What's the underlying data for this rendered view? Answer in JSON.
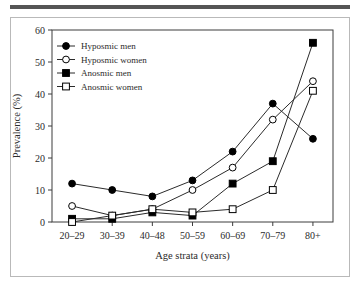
{
  "figure": {
    "top_rule_color": "#555555",
    "frame_color": "#b9b9b9"
  },
  "chart_data": {
    "type": "line",
    "title": "",
    "xlabel": "Age strata (years)",
    "ylabel": "Prevalence (%)",
    "categories": [
      "20–29",
      "30–39",
      "40–48",
      "50–59",
      "60–69",
      "70–79",
      "80+"
    ],
    "ylim": [
      0,
      60
    ],
    "yticks": [
      0,
      10,
      20,
      30,
      40,
      50,
      60
    ],
    "ytick_labels": [
      "0",
      "10",
      "20",
      "30",
      "40",
      "50",
      "60"
    ],
    "grid": false,
    "legend_position": "upper left",
    "series": [
      {
        "name": "Hyposmic men",
        "marker": "filled-circle",
        "color": "#000000",
        "values": [
          12,
          10,
          8,
          13,
          22,
          37,
          26
        ]
      },
      {
        "name": "Hyposmic women",
        "marker": "open-circle",
        "color": "#000000",
        "values": [
          5,
          2,
          4,
          10,
          17,
          32,
          44
        ]
      },
      {
        "name": "Anosmic men",
        "marker": "filled-square",
        "color": "#000000",
        "values": [
          1,
          1,
          3,
          2,
          12,
          19,
          56
        ]
      },
      {
        "name": "Anosmic women",
        "marker": "open-square",
        "color": "#000000",
        "values": [
          0,
          2,
          4,
          3,
          4,
          10,
          41
        ]
      }
    ]
  }
}
